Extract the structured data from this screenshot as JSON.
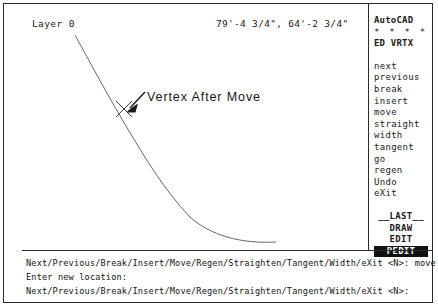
{
  "app": {
    "name": "AutoCAD"
  },
  "status_bar": {
    "layer_label": "Layer 0",
    "coordinates": "79'-4 3/4\", 64'-2 3/4\""
  },
  "drawing": {
    "annotation_label": "Vertex After Move",
    "vertex_marker": "x-marker",
    "curve_color": "#555555",
    "arrow_color": "#1a1a1a"
  },
  "screen_menu": {
    "header": {
      "title": "AutoCAD",
      "stars": "* * * *",
      "mode": "ED VRTX"
    },
    "items": [
      "next",
      "previous",
      "break",
      "insert",
      "move",
      "straight",
      "width",
      "tangent",
      "go",
      "regen",
      "Undo",
      "eXit"
    ],
    "footer": [
      "__LAST__",
      "DRAW",
      "EDIT"
    ],
    "selected_item": "PEDIT"
  },
  "command_area": {
    "lines": [
      "Next/Previous/Break/Insert/Move/Regen/Straighten/Tangent/Width/eXit <N>: move",
      "Enter new location:",
      "Next/Previous/Break/Insert/Move/Regen/Straighten/Tangent/Width/eXit <N>:"
    ]
  }
}
